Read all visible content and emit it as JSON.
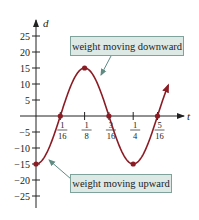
{
  "chart_data": {
    "type": "line",
    "title": "",
    "xlabel": "t",
    "ylabel": "d",
    "x_ticks": [
      {
        "num": "1",
        "den": "16",
        "value": 0.0625
      },
      {
        "num": "1",
        "den": "8",
        "value": 0.125
      },
      {
        "num": "3",
        "den": "16",
        "value": 0.1875
      },
      {
        "num": "1",
        "den": "4",
        "value": 0.25
      },
      {
        "num": "5",
        "den": "16",
        "value": 0.3125
      }
    ],
    "y_ticks": [
      25,
      20,
      15,
      10,
      5,
      -5,
      -10,
      -15,
      -20,
      -25
    ],
    "y_tick_labels": [
      "25",
      "20",
      "15",
      "10",
      "5",
      "−5",
      "−10",
      "−15",
      "−20",
      "−25"
    ],
    "ylim": [
      -27,
      28
    ],
    "xlim": [
      0,
      0.36
    ],
    "function": "d = -15 cos(8πt)",
    "series": [
      {
        "name": "d(t)",
        "x": [
          0,
          0.0625,
          0.125,
          0.1875,
          0.25,
          0.3125,
          0.34
        ],
        "values": [
          -15,
          0,
          15,
          0,
          -15,
          0,
          7
        ]
      }
    ],
    "marked_points": [
      {
        "t": 0,
        "d": -15
      },
      {
        "t": 0.0625,
        "d": 0
      },
      {
        "t": 0.125,
        "d": 15
      },
      {
        "t": 0.1875,
        "d": 0
      },
      {
        "t": 0.25,
        "d": -15
      },
      {
        "t": 0.3125,
        "d": 0
      }
    ],
    "annotations": [
      {
        "text": "weight moving downward",
        "points_to": "decreasing segment near t=3/16"
      },
      {
        "text": "weight moving upward",
        "points_to": "increasing segment near t=1/32"
      }
    ],
    "grid": false,
    "colors": {
      "curve": "#8b1c24",
      "annotation_fill": "#dde9e5",
      "annotation_border": "#7fa39b",
      "pointer": "#5f8b82"
    }
  },
  "labels": {
    "x_axis": "t",
    "y_axis": "d",
    "note_down": "weight moving downward",
    "note_up": "weight moving upward"
  }
}
